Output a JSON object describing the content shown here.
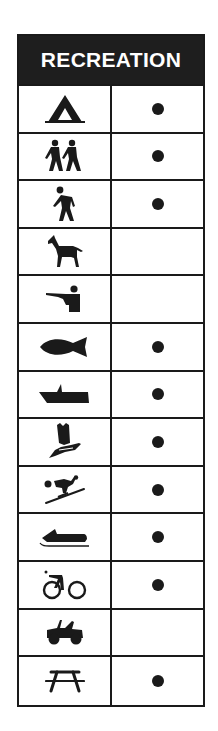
{
  "title": "RECREATION",
  "colors": {
    "ink": "#1a1a1a",
    "header_bg": "#1e1e1e",
    "header_text": "#ffffff",
    "background": "#ffffff"
  },
  "rows": [
    {
      "activity": "camping",
      "icon": "tent-icon",
      "available": true
    },
    {
      "activity": "hiking",
      "icon": "hikers-icon",
      "available": true
    },
    {
      "activity": "walking",
      "icon": "hiker-icon",
      "available": true
    },
    {
      "activity": "horseback riding",
      "icon": "horse-icon",
      "available": false
    },
    {
      "activity": "hunting",
      "icon": "hunter-rifle-icon",
      "available": false
    },
    {
      "activity": "fishing",
      "icon": "fish-icon",
      "available": true
    },
    {
      "activity": "boating",
      "icon": "boat-icon",
      "available": true
    },
    {
      "activity": "wildlife viewing",
      "icon": "bird-on-hand-icon",
      "available": true
    },
    {
      "activity": "skiing",
      "icon": "skier-icon",
      "available": true
    },
    {
      "activity": "snowmobiling",
      "icon": "snowmobile-icon",
      "available": true
    },
    {
      "activity": "bicycling",
      "icon": "bicycle-icon",
      "available": true
    },
    {
      "activity": "off-road vehicles",
      "icon": "jeep-icon",
      "available": false
    },
    {
      "activity": "picnicking",
      "icon": "picnic-table-icon",
      "available": true
    }
  ]
}
